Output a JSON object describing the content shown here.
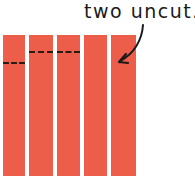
{
  "caption": {
    "text": "two uncut."
  },
  "colors": {
    "strip": "#ec5d4a",
    "dash": "#2a1a14",
    "ink": "#1a1a1a",
    "background": "#ffffff"
  },
  "strips": [
    {
      "index": 1,
      "x": 3,
      "width": 22,
      "cut": true,
      "cut_y": 63
    },
    {
      "index": 2,
      "x": 29,
      "width": 24,
      "cut": true,
      "cut_y": 52
    },
    {
      "index": 3,
      "x": 57,
      "width": 23,
      "cut": true,
      "cut_y": 52
    },
    {
      "index": 4,
      "x": 84,
      "width": 23,
      "cut": false
    },
    {
      "index": 5,
      "x": 111,
      "width": 25,
      "cut": false
    }
  ],
  "arrow": {
    "from": "caption",
    "to": "strip-5",
    "icon": "curved-arrow-icon"
  }
}
